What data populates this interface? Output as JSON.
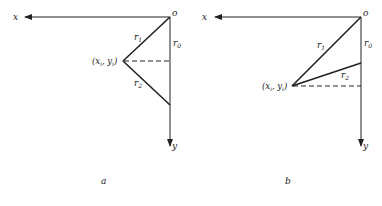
{
  "panels": [
    {
      "id": "a",
      "caption": "a",
      "origin_label": "o",
      "x_axis_label": "x",
      "y_axis_label": "y",
      "point_label": "(x_i, y_i)",
      "point_label_text": "(x",
      "r1_label": "r",
      "r1_sub": "1",
      "r2_label": "r",
      "r2_sub": "2",
      "r0_label": "r",
      "r0_sub": "0",
      "sub_i": "i",
      "comma_y": ", y",
      "close_paren": ")"
    },
    {
      "id": "b",
      "caption": "b",
      "origin_label": "o",
      "x_axis_label": "x",
      "y_axis_label": "y",
      "point_label": "(x_i, y_i)",
      "point_label_text": "(x",
      "r1_label": "r",
      "r1_sub": "1",
      "r2_label": "r",
      "r2_sub": "2",
      "r0_label": "r",
      "r0_sub": "0",
      "sub_i": "i",
      "comma_y": ", y",
      "close_paren": ")"
    }
  ],
  "colors": {
    "line": "#222222",
    "background": "#ffffff"
  }
}
